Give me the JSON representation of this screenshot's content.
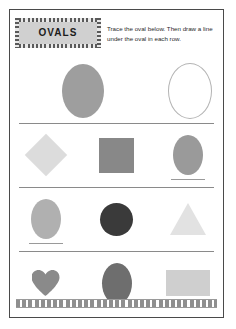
{
  "worksheet": {
    "title": "OVALS",
    "instructions": "Trace the oval below. Then draw a line under the oval in each row.",
    "colors": {
      "page_border": "#4a4a4a",
      "banner_fill": "#d0d0d0",
      "divider": "#8a8a8a",
      "answer_line": "#9a9a9a"
    },
    "example_row": {
      "shapes": [
        {
          "name": "oval-filled",
          "type": "oval",
          "color": "#9e9e9e",
          "width": 42,
          "height": 54,
          "outline": false,
          "line": false
        },
        {
          "name": "oval-trace",
          "type": "oval",
          "color": "#b4b4b4",
          "width": 42,
          "height": 54,
          "outline": true,
          "line": false
        }
      ]
    },
    "rows": [
      {
        "index": 1,
        "shapes": [
          {
            "name": "diamond",
            "type": "diamond",
            "color": "#dcdcdc",
            "width": 30,
            "height": 30,
            "outline": false,
            "line": false
          },
          {
            "name": "square",
            "type": "square",
            "color": "#888888",
            "width": 35,
            "height": 35,
            "outline": false,
            "line": false
          },
          {
            "name": "oval",
            "type": "oval",
            "color": "#9a9a9a",
            "width": 30,
            "height": 40,
            "outline": false,
            "line": true
          }
        ]
      },
      {
        "index": 2,
        "shapes": [
          {
            "name": "oval",
            "type": "oval",
            "color": "#b0b0b0",
            "width": 30,
            "height": 40,
            "outline": false,
            "line": true
          },
          {
            "name": "circle",
            "type": "circle",
            "color": "#3a3a3a",
            "width": 33,
            "height": 33,
            "outline": false,
            "line": false
          },
          {
            "name": "triangle",
            "type": "triangle",
            "color": "#e2e2e2",
            "width": 36,
            "height": 32,
            "outline": false,
            "line": false
          }
        ]
      },
      {
        "index": 3,
        "shapes": [
          {
            "name": "heart",
            "type": "heart",
            "color": "#8a8a8a",
            "width": 28,
            "height": 26,
            "outline": false,
            "line": false
          },
          {
            "name": "oval",
            "type": "oval",
            "color": "#6e6e6e",
            "width": 30,
            "height": 41,
            "outline": false,
            "line": true
          },
          {
            "name": "rectangle",
            "type": "rect",
            "color": "#cfcfcf",
            "width": 44,
            "height": 26,
            "outline": false,
            "line": false
          }
        ]
      }
    ]
  }
}
